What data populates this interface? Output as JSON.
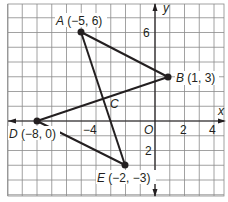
{
  "plane": {
    "unit_px": 14.75,
    "origin_px": [
      155,
      121
    ],
    "x_range": [
      -10,
      4.8
    ],
    "y_range": [
      -5,
      8
    ],
    "grid_color": "#8a8a8a",
    "axis_color": "#231f20",
    "line_color": "#231f20"
  },
  "axes": {
    "x_label": "x",
    "y_label": "y",
    "origin_label": "O",
    "ticks": [
      {
        "axis": "x",
        "value": -4,
        "label": "−4"
      },
      {
        "axis": "x",
        "value": 2,
        "label": "2"
      },
      {
        "axis": "x",
        "value": 4,
        "label": "4"
      },
      {
        "axis": "y",
        "value": 6,
        "label": "6"
      },
      {
        "axis": "y",
        "value": -2,
        "label": "2"
      }
    ]
  },
  "points": [
    {
      "name": "A",
      "coords": "(−5, 6)",
      "x": -5,
      "y": 6
    },
    {
      "name": "B",
      "coords": "(1, 3)",
      "x": 1,
      "y": 3
    },
    {
      "name": "C",
      "coords": "",
      "x": -2.6,
      "y": 1.6
    },
    {
      "name": "D",
      "coords": "(−8, 0)",
      "x": -8,
      "y": 0
    },
    {
      "name": "E",
      "coords": "(−2, −3)",
      "x": -2,
      "y": -3
    }
  ],
  "segments": [
    [
      "A",
      "B"
    ],
    [
      "A",
      "E"
    ],
    [
      "D",
      "B"
    ],
    [
      "D",
      "E"
    ]
  ],
  "labels": {
    "A": "A",
    "A_coords": " (−5, 6)",
    "B": "B",
    "B_coords": " (1, 3)",
    "C": "C",
    "D": "D",
    "D_coords": " (−8, 0)",
    "E": "E",
    "E_coords": " (−2, −3)"
  }
}
